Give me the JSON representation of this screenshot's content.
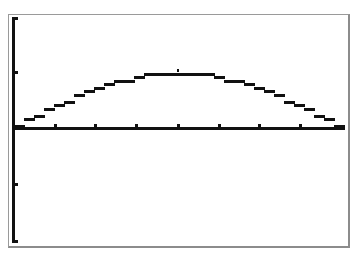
{
  "screen": {
    "type": "graphing-calculator-graph-screen",
    "colors": {
      "background": "#ffffff",
      "ink": "#111111",
      "frame": "#9a9a9a"
    }
  },
  "graph": {
    "axes": {
      "origin_px": [
        14,
        128
      ],
      "x_axis": {
        "start_px": 14,
        "end_px": 344,
        "tick_px": [
          55,
          95,
          136,
          178,
          219,
          259,
          300
        ]
      },
      "y_axis": {
        "top_px": 17,
        "bottom_px": 242,
        "tick_px": [
          72,
          184
        ]
      }
    },
    "curve": {
      "shape": "arch",
      "start_px": [
        14,
        127
      ],
      "peak_px": [
        178,
        73
      ],
      "end_px": [
        344,
        127
      ]
    }
  }
}
